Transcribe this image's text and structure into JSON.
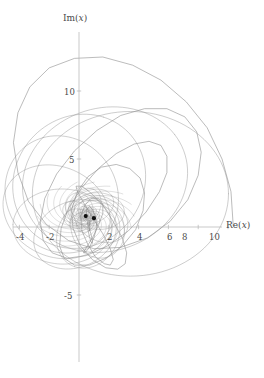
{
  "figure": {
    "background_color": "#ffffff",
    "curve_color": "#8c8c8c",
    "axis_color": "#b0b0b0",
    "marker_color": "#111111",
    "text_color": "#4a4a4a"
  },
  "axes": {
    "x_title_fn": "Re",
    "x_title_arg": "x",
    "y_title_fn": "Im",
    "y_title_arg": "x",
    "x_title_full": "Re(x)",
    "y_title_full": "Im(x)",
    "x_ticks": [
      "-4",
      "-2",
      "2",
      "4",
      "6",
      "8",
      "10"
    ],
    "y_ticks": [
      "10",
      "5",
      "-5"
    ]
  },
  "chart_data": {
    "type": "line",
    "title": "",
    "subtitle": "",
    "xlabel": "Re(x)",
    "ylabel": "Im(x)",
    "xlim": [
      -5,
      11.5
    ],
    "ylim": [
      -8.5,
      13.5
    ],
    "grid": false,
    "legend": null,
    "x_tick_values": [
      -4,
      -2,
      2,
      4,
      6,
      8,
      10
    ],
    "x_tick_labels": [
      "-4",
      "-2",
      "2",
      "4",
      "6",
      "8",
      "10"
    ],
    "y_tick_values": [
      10,
      5,
      -5
    ],
    "y_tick_labels": [
      "10",
      "5",
      "-5"
    ],
    "markers": [
      {
        "label": "",
        "re": 0.45,
        "im": 0.8
      },
      {
        "label": "",
        "re": 1.0,
        "im": 0.65
      }
    ],
    "series": [
      {
        "name": "orbit",
        "comment": "Sampled complex trajectory (Re, Im) pairs traced by the curve.",
        "points_re": [
          10.35,
          10.2,
          9.6,
          8.6,
          7.2,
          5.5,
          3.6,
          1.6,
          -0.3,
          -2.0,
          -3.3,
          -4.1,
          -4.4,
          -4.1,
          -3.4,
          -2.2,
          -0.7,
          1.0,
          2.8,
          4.6,
          6.1,
          7.3,
          8.0,
          8.2,
          7.9,
          7.1,
          5.9,
          4.4,
          2.8,
          1.2,
          -0.3,
          -1.5,
          -2.3,
          -2.6,
          -2.4,
          -1.8,
          -0.8,
          0.5,
          1.9,
          3.3,
          4.5,
          5.4,
          5.9,
          5.9,
          5.5,
          4.7,
          3.7,
          2.5,
          1.3,
          0.2,
          -0.7,
          -1.2,
          -1.3,
          -1.0,
          -0.3,
          0.7,
          1.8,
          2.9,
          3.8,
          4.3,
          4.4,
          4.1,
          3.4,
          2.5,
          1.5,
          0.6,
          -0.1,
          -0.5,
          -0.4,
          0.1,
          0.9,
          1.8,
          2.6,
          3.1,
          3.2,
          2.9,
          2.3,
          1.6,
          0.8,
          0.2,
          -0.2,
          -0.1,
          0.3,
          0.9,
          1.6,
          2.1,
          2.3,
          2.1,
          1.7,
          1.1,
          0.6,
          0.2,
          0.1,
          0.4,
          0.8,
          1.3,
          1.6,
          1.6,
          1.3,
          0.9,
          0.5,
          0.3,
          0.4,
          0.7,
          1.0,
          1.2,
          1.1,
          0.9,
          0.7,
          0.5,
          0.5,
          0.6,
          0.8,
          0.9,
          0.9,
          0.8,
          0.7,
          0.6,
          0.6,
          0.7,
          0.8,
          0.8,
          0.75,
          0.7,
          0.68,
          0.7,
          0.72,
          0.73,
          0.72,
          0.71
        ],
        "points_im": [
          0.1,
          2.6,
          5.0,
          7.3,
          9.2,
          10.8,
          11.9,
          12.5,
          12.4,
          11.7,
          10.3,
          8.4,
          6.2,
          4.0,
          1.9,
          0.2,
          -1.0,
          -1.6,
          -1.5,
          -0.8,
          0.4,
          2.0,
          3.8,
          5.5,
          7.0,
          8.1,
          8.7,
          8.7,
          8.2,
          7.1,
          5.6,
          3.9,
          2.1,
          0.4,
          -1.0,
          -1.9,
          -2.3,
          -2.1,
          -1.4,
          -0.3,
          1.1,
          2.6,
          4.0,
          5.2,
          6.0,
          6.3,
          6.1,
          5.4,
          4.3,
          2.9,
          1.4,
          -0.1,
          -1.4,
          -2.3,
          -2.8,
          -2.8,
          -2.3,
          -1.4,
          -0.2,
          1.2,
          2.5,
          3.6,
          4.3,
          4.6,
          4.4,
          3.7,
          2.6,
          1.3,
          -0.1,
          -1.4,
          -2.4,
          -3.0,
          -3.1,
          -2.7,
          -1.9,
          -0.8,
          0.4,
          1.6,
          2.5,
          3.0,
          3.0,
          2.6,
          1.8,
          0.7,
          -0.5,
          -1.6,
          -2.4,
          -2.8,
          -2.7,
          -2.2,
          -1.3,
          -0.3,
          0.8,
          1.6,
          2.1,
          2.1,
          1.7,
          1.0,
          0.1,
          -0.8,
          -1.5,
          -1.9,
          -1.9,
          -1.5,
          -0.8,
          0.0,
          0.8,
          1.3,
          1.5,
          1.3,
          0.8,
          0.2,
          -0.5,
          -1.0,
          -1.2,
          -1.1,
          -0.7,
          -0.2,
          0.3,
          0.7,
          0.9,
          0.8,
          0.5,
          0.2,
          -0.1,
          -0.3,
          -0.2,
          0.0,
          0.3,
          0.5
        ]
      }
    ]
  }
}
